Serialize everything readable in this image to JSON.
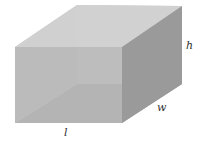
{
  "diagram": {
    "labels": {
      "height": "h",
      "width": "w",
      "length": "l"
    },
    "colors": {
      "top_face": "#cfcfcf",
      "front_face": "#b9b9b9",
      "side_face": "#9c9c9c",
      "back_face": "#c9c9c9",
      "bottom_face": "#a9a9a9",
      "background": "#ffffff"
    }
  }
}
